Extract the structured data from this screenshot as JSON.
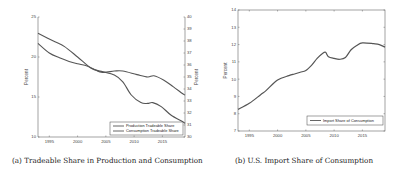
{
  "captions": {
    "a": "(a) Tradeable Share in Production and Consumption",
    "b": "(b) U.S. Import Share of Consumption"
  },
  "chart_data": [
    {
      "type": "line",
      "title": "(a) Tradeable Share in Production and Consumption",
      "xlabel": "",
      "ylabel": "Percent",
      "ylabel_right": "Percent",
      "xlim": [
        1993,
        2019
      ],
      "ylim": [
        10,
        25
      ],
      "ylim_right": [
        30,
        40
      ],
      "x_ticks": [
        1995,
        2000,
        2005,
        2010,
        2015
      ],
      "y_ticks": [
        10,
        15,
        20,
        25
      ],
      "y_ticks_right": [
        30,
        31,
        32,
        33,
        34,
        35,
        36,
        37,
        38,
        39,
        40
      ],
      "grid": false,
      "legend_position": "lower right",
      "series": [
        {
          "name": "Production Tradeable Share",
          "axis": "left",
          "color": "#555555",
          "x": [
            1993,
            1996,
            1997.7,
            2000,
            2002.4,
            2004.2,
            2006.5,
            2008,
            2009.5,
            2011.2,
            2012.4,
            2013.3,
            2014.8,
            2016.5,
            2018.6,
            2019
          ],
          "values": [
            22.96,
            21.9,
            21.3,
            20.0,
            18.6,
            18.2,
            17.75,
            16.9,
            15.25,
            14.3,
            14.2,
            14.3,
            13.8,
            12.75,
            11.9,
            11.7
          ]
        },
        {
          "name": "Consumption Tradeable Share",
          "axis": "right",
          "color": "#555555",
          "x": [
            1993,
            1995,
            1996.8,
            1998.5,
            2000,
            2001.8,
            2004.2,
            2006.5,
            2008,
            2010.5,
            2012.4,
            2013.5,
            2015.2,
            2016.9,
            2018.6,
            2019
          ],
          "values": [
            37.8,
            37.0,
            36.6,
            36.3,
            36.1,
            35.9,
            35.4,
            35.5,
            35.5,
            35.2,
            35.0,
            35.1,
            34.75,
            34.2,
            33.6,
            33.5
          ]
        }
      ]
    },
    {
      "type": "line",
      "title": "(b) U.S. Import Share of Consumption",
      "xlabel": "",
      "ylabel": "Percent",
      "xlim": [
        1993,
        2019
      ],
      "ylim": [
        7,
        14
      ],
      "x_ticks": [
        1995,
        2000,
        2005,
        2010,
        2015
      ],
      "y_ticks": [
        7,
        8,
        9,
        10,
        11,
        12,
        13,
        14
      ],
      "grid": false,
      "legend_position": "lower right",
      "series": [
        {
          "name": "Import Share of Consumption",
          "color": "#555555",
          "x": [
            1993,
            1995,
            1997,
            1998,
            2000,
            2002,
            2003,
            2004,
            2005,
            2006,
            2007,
            2008,
            2008.5,
            2009,
            2010,
            2011,
            2012,
            2013,
            2014,
            2015,
            2017,
            2018,
            2019
          ],
          "values": [
            8.25,
            8.6,
            9.1,
            9.35,
            9.95,
            10.2,
            10.3,
            10.4,
            10.5,
            10.8,
            11.2,
            11.5,
            11.55,
            11.3,
            11.2,
            11.15,
            11.25,
            11.7,
            11.95,
            12.1,
            12.05,
            12.0,
            11.85
          ]
        }
      ]
    }
  ]
}
